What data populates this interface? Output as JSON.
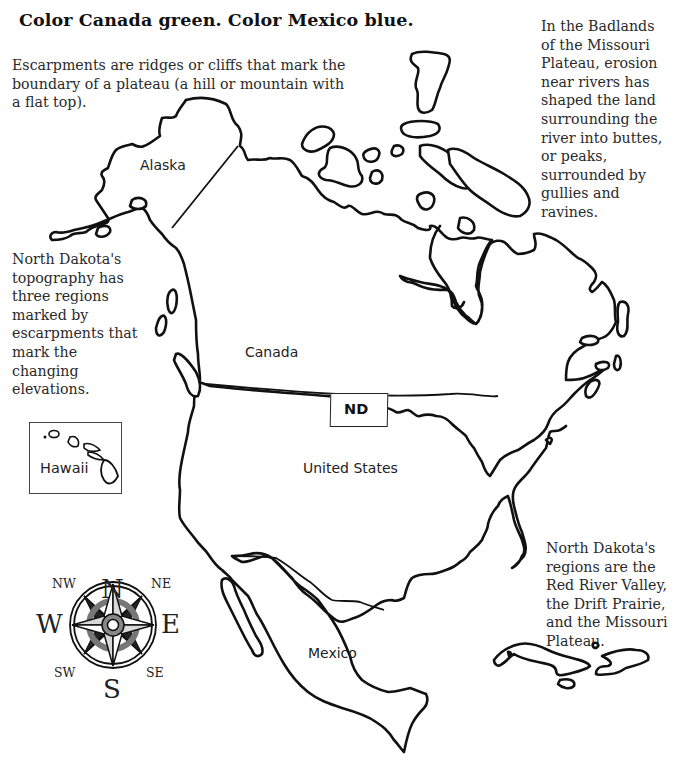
{
  "title": "Color Canada green. Color Mexico blue.",
  "paragraphs": {
    "escarpments": [
      "Escarpments are ridges or cliffs that mark the",
      "boundary of a plateau (a hill or mountain with",
      "a flat top)."
    ],
    "badlands": [
      "In the Badlands",
      "of the Missouri",
      "Plateau, erosion",
      "near rivers has",
      "shaped the land",
      "surrounding the",
      "river into buttes,",
      "or peaks,",
      "surrounded by",
      "gullies and",
      "ravines."
    ],
    "topography": [
      "North Dakota's",
      "topography has",
      "three regions",
      "marked by",
      "escarpments that",
      "mark the",
      "changing",
      "elevations."
    ],
    "regions": [
      "North Dakota's",
      "regions are the",
      "Red River Valley,",
      "the Drift Prairie,",
      "and the Missouri",
      "Plateau."
    ]
  },
  "map": {
    "labels": {
      "alaska": "Alaska",
      "canada": "Canada",
      "nd": "ND",
      "united_states": "United States",
      "hawaii": "Hawaii",
      "mexico": "Mexico"
    },
    "instructions": {
      "canada_color": "green",
      "mexico_color": "blue"
    }
  },
  "compass": {
    "n": "N",
    "s": "S",
    "e": "E",
    "w": "W",
    "ne": "NE",
    "nw": "NW",
    "se": "SE",
    "sw": "SW"
  }
}
